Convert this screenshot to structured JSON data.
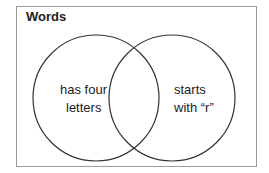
{
  "diagram": {
    "type": "venn",
    "title": "Words",
    "sets": [
      {
        "label_line1": "has four",
        "label_line2": "letters"
      },
      {
        "label_line1": "starts",
        "label_line2": "with “r”"
      }
    ]
  }
}
